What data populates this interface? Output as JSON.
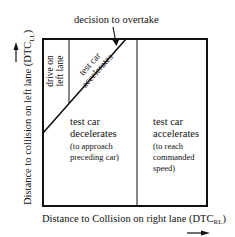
{
  "diagram": {
    "annotation_top": "decision to overtake",
    "y_axis": {
      "label": "Distance to collision on left lane (DTC",
      "subscript": "LL",
      "close": ")"
    },
    "x_axis": {
      "label": "Distance to Collision on right lane (DTC",
      "subscript": "RL",
      "close": ")"
    },
    "regions": {
      "drive_left": {
        "line1": "drive on",
        "line2": "left lane"
      },
      "accelerate_diag": {
        "line1": "test car",
        "line2": "accelerates"
      },
      "decelerate": {
        "line1": "test car",
        "line2": "decelerates",
        "line3": "(to approach",
        "line4": "preceding car)"
      },
      "accelerate_right": {
        "line1": "test car",
        "line2": "accelerates",
        "line3": "(to reach",
        "line4": "commanded",
        "line5": "speed)"
      }
    },
    "colors": {
      "ink": "#111111",
      "background": "#ffffff"
    }
  }
}
